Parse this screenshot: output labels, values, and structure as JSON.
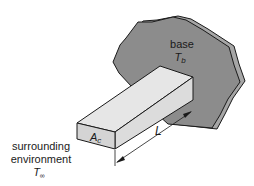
{
  "figure": {
    "type": "fin-diagram",
    "labels": {
      "base": "base",
      "base_temp_symbol": "T",
      "base_temp_subscript": "b",
      "area_symbol": "A",
      "area_subscript": "c",
      "length": "L",
      "environment_line1": "surrounding",
      "environment_line2": "environment",
      "env_temp_symbol": "T",
      "env_temp_subscript": "∞"
    },
    "colors": {
      "base_fill": "#8c8c8c",
      "base_edge_fill": "#a6a6a6",
      "bar_top": "#e6e6e6",
      "bar_front": "#d4d4d4",
      "bar_side": "#dcdcdc",
      "stroke": "#1a1a1a"
    }
  }
}
